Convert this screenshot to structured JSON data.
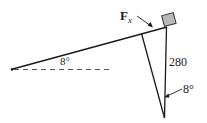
{
  "diagram": {
    "force_label_main": "F",
    "force_label_sub": "x",
    "incline_angle_label": "8°",
    "vertical_force_label": "280",
    "lower_angle_label": "8°"
  },
  "colors": {
    "line": "#1a1a1a",
    "box_fill": "#b8b8b8",
    "box_stroke": "#333333"
  }
}
